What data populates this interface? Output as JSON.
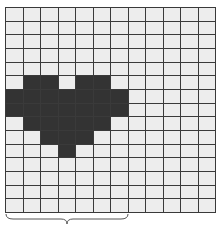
{
  "grid": {
    "columns": 12,
    "rows": 15,
    "cell_color": "#ededed",
    "filled_color": "#333333",
    "line_color": "#3a3a3a",
    "filled_cells": [
      [
        5,
        1
      ],
      [
        5,
        2
      ],
      [
        5,
        4
      ],
      [
        5,
        5
      ],
      [
        6,
        0
      ],
      [
        6,
        1
      ],
      [
        6,
        2
      ],
      [
        6,
        3
      ],
      [
        6,
        4
      ],
      [
        6,
        5
      ],
      [
        6,
        6
      ],
      [
        7,
        0
      ],
      [
        7,
        1
      ],
      [
        7,
        2
      ],
      [
        7,
        3
      ],
      [
        7,
        4
      ],
      [
        7,
        5
      ],
      [
        7,
        6
      ],
      [
        8,
        1
      ],
      [
        8,
        2
      ],
      [
        8,
        3
      ],
      [
        8,
        4
      ],
      [
        8,
        5
      ],
      [
        9,
        2
      ],
      [
        9,
        3
      ],
      [
        9,
        4
      ],
      [
        10,
        3
      ]
    ],
    "shape": "heart"
  },
  "brace": {
    "orientation": "horizontal-below",
    "span_columns": [
      0,
      6
    ],
    "color": "#555555"
  }
}
